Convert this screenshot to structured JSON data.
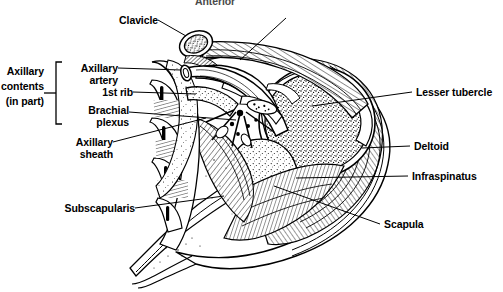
{
  "figure": {
    "title": "Anterior",
    "title_note": "clipped at top edge of image",
    "type": "anatomical-cross-section",
    "region": "axilla and shoulder, sagittal section",
    "background_color": "#ffffff",
    "ink_color": "#000000"
  },
  "bracket": {
    "label_line1": "Axillary",
    "label_line2": "contents",
    "label_line3": "(in part)",
    "groups": [
      "Axillary artery",
      "1st rib",
      "Brachial plexus"
    ]
  },
  "labels": {
    "clavicle": "Clavicle",
    "pectoralis_major": "Pectoralis major",
    "axillary_artery_l1": "Axillary",
    "axillary_artery_l2": "artery",
    "first_rib": "1st rib",
    "brachial_plexus_l1": "Brachial",
    "brachial_plexus_l2": "plexus",
    "axillary_sheath_l1": "Axillary",
    "axillary_sheath_l2": "sheath",
    "subscapularis": "Subscapularis",
    "lesser_tubercle": "Lesser tubercle",
    "deltoid": "Deltoid",
    "infraspinatus": "Infraspinatus",
    "scapula": "Scapula"
  }
}
